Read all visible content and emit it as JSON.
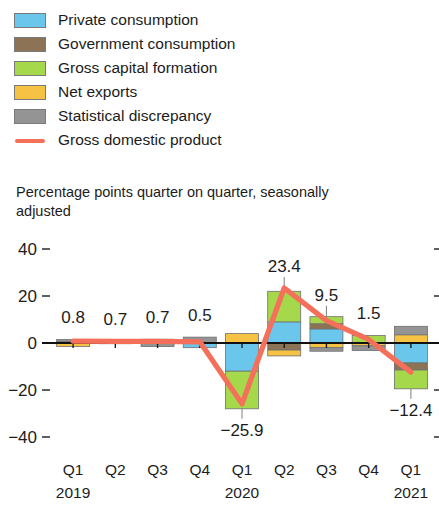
{
  "legend": {
    "items": [
      {
        "label": "Private consumption",
        "color": "#6bc6ec",
        "type": "swatch",
        "icon": "legend-swatch-private-consumption"
      },
      {
        "label": "Government consumption",
        "color": "#8c7355",
        "type": "swatch",
        "icon": "legend-swatch-government-consumption"
      },
      {
        "label": "Gross capital formation",
        "color": "#a5d94b",
        "type": "swatch",
        "icon": "legend-swatch-gross-capital-formation"
      },
      {
        "label": "Net exports",
        "color": "#f5c243",
        "type": "swatch",
        "icon": "legend-swatch-net-exports"
      },
      {
        "label": "Statistical discrepancy",
        "color": "#949494",
        "type": "swatch",
        "icon": "legend-swatch-statistical-discrepancy"
      },
      {
        "label": "Gross domestic product",
        "color": "#f4705a",
        "type": "line",
        "icon": "legend-line-gross-domestic-product"
      }
    ]
  },
  "subtitle": "Percentage points quarter on quarter, seasonally adjusted",
  "chart_data": {
    "type": "bar",
    "subtype": "stacked-bar-with-line",
    "title": "",
    "subtitle": "Percentage points quarter on quarter, seasonally adjusted",
    "xlabel": "",
    "ylabel": "",
    "ylim": [
      -44,
      44
    ],
    "yticks": [
      40,
      20,
      0,
      -20,
      -40
    ],
    "ytick_labels": [
      "40",
      "20",
      "0",
      "−20",
      "−40"
    ],
    "grid": false,
    "legend_position": "above-plot",
    "categories": [
      "Q1",
      "Q2",
      "Q3",
      "Q4",
      "Q1",
      "Q2",
      "Q3",
      "Q4",
      "Q1"
    ],
    "year_groups": [
      {
        "label": "2019",
        "start_index": 0
      },
      {
        "label": "2020",
        "start_index": 4
      },
      {
        "label": "2021",
        "start_index": 8
      }
    ],
    "series": [
      {
        "name": "Private consumption",
        "color": "#6bc6ec",
        "values": [
          0.0,
          0.0,
          0.0,
          -2.0,
          -12.0,
          9.0,
          6.0,
          0.0,
          -8.5
        ]
      },
      {
        "name": "Government consumption",
        "color": "#8c7355",
        "values": [
          0.6,
          0.2,
          0.6,
          0.0,
          0.0,
          -3.0,
          2.2,
          0.0,
          -3.0
        ]
      },
      {
        "name": "Gross capital formation",
        "color": "#a5d94b",
        "values": [
          0.0,
          0.2,
          0.0,
          0.0,
          -16.0,
          13.0,
          3.0,
          3.2,
          -8.0
        ]
      },
      {
        "name": "Net exports",
        "color": "#f5c243",
        "values": [
          -1.5,
          0.3,
          1.0,
          0.0,
          4.0,
          -2.5,
          -2.0,
          -1.2,
          3.5
        ]
      },
      {
        "name": "Statistical discrepancy",
        "color": "#949494",
        "values": [
          0.9,
          0.0,
          -1.5,
          2.5,
          0.0,
          0.0,
          -1.5,
          -2.0,
          3.6
        ]
      }
    ],
    "line_series": {
      "name": "Gross domestic product",
      "color": "#f4705a",
      "values": [
        0.8,
        0.7,
        0.7,
        0.5,
        -25.9,
        23.4,
        9.5,
        1.5,
        -12.4
      ]
    },
    "data_labels": [
      {
        "index": 0,
        "text": "0.8",
        "value": 0.8,
        "position": "above"
      },
      {
        "index": 1,
        "text": "0.7",
        "value": 0.7,
        "position": "above"
      },
      {
        "index": 2,
        "text": "0.7",
        "value": 0.7,
        "position": "above"
      },
      {
        "index": 3,
        "text": "0.5",
        "value": 0.5,
        "position": "above"
      },
      {
        "index": 4,
        "text": "−25.9",
        "value": -25.9,
        "position": "below"
      },
      {
        "index": 5,
        "text": "23.4",
        "value": 23.4,
        "position": "above"
      },
      {
        "index": 6,
        "text": "9.5",
        "value": 9.5,
        "position": "above"
      },
      {
        "index": 7,
        "text": "1.5",
        "value": 1.5,
        "position": "above"
      },
      {
        "index": 8,
        "text": "−12.4",
        "value": -12.4,
        "position": "below"
      }
    ]
  }
}
